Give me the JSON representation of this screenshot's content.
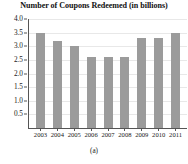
{
  "figure": {
    "caption": "(a)"
  },
  "chart_data": {
    "type": "bar",
    "title": "Number of Coupons Redeemed (in billions)",
    "xlabel": "",
    "ylabel": "",
    "categories": [
      "2003",
      "2004",
      "2005",
      "2006",
      "2007",
      "2008",
      "2009",
      "2010",
      "2011"
    ],
    "values": [
      3.5,
      3.2,
      3.0,
      2.6,
      2.6,
      2.6,
      3.3,
      3.3,
      3.5
    ],
    "series": [
      {
        "name": "Coupons Redeemed",
        "values": [
          3.5,
          3.2,
          3.0,
          2.6,
          2.6,
          2.6,
          3.3,
          3.3,
          3.5
        ]
      }
    ],
    "ylim": [
      0.0,
      4.0
    ],
    "ytick_labels": [
      "4.0",
      "3.5",
      "3.0",
      "2.5",
      "2.0",
      "1.5",
      "1.0",
      "0.5"
    ],
    "ytick_values": [
      4.0,
      3.5,
      3.0,
      2.5,
      2.0,
      1.5,
      1.0,
      0.5
    ],
    "grid": true,
    "legend": false,
    "bar_color": "#9b9b9b",
    "axis_color": "#555555",
    "gridline_color": "#e8e8e8"
  }
}
